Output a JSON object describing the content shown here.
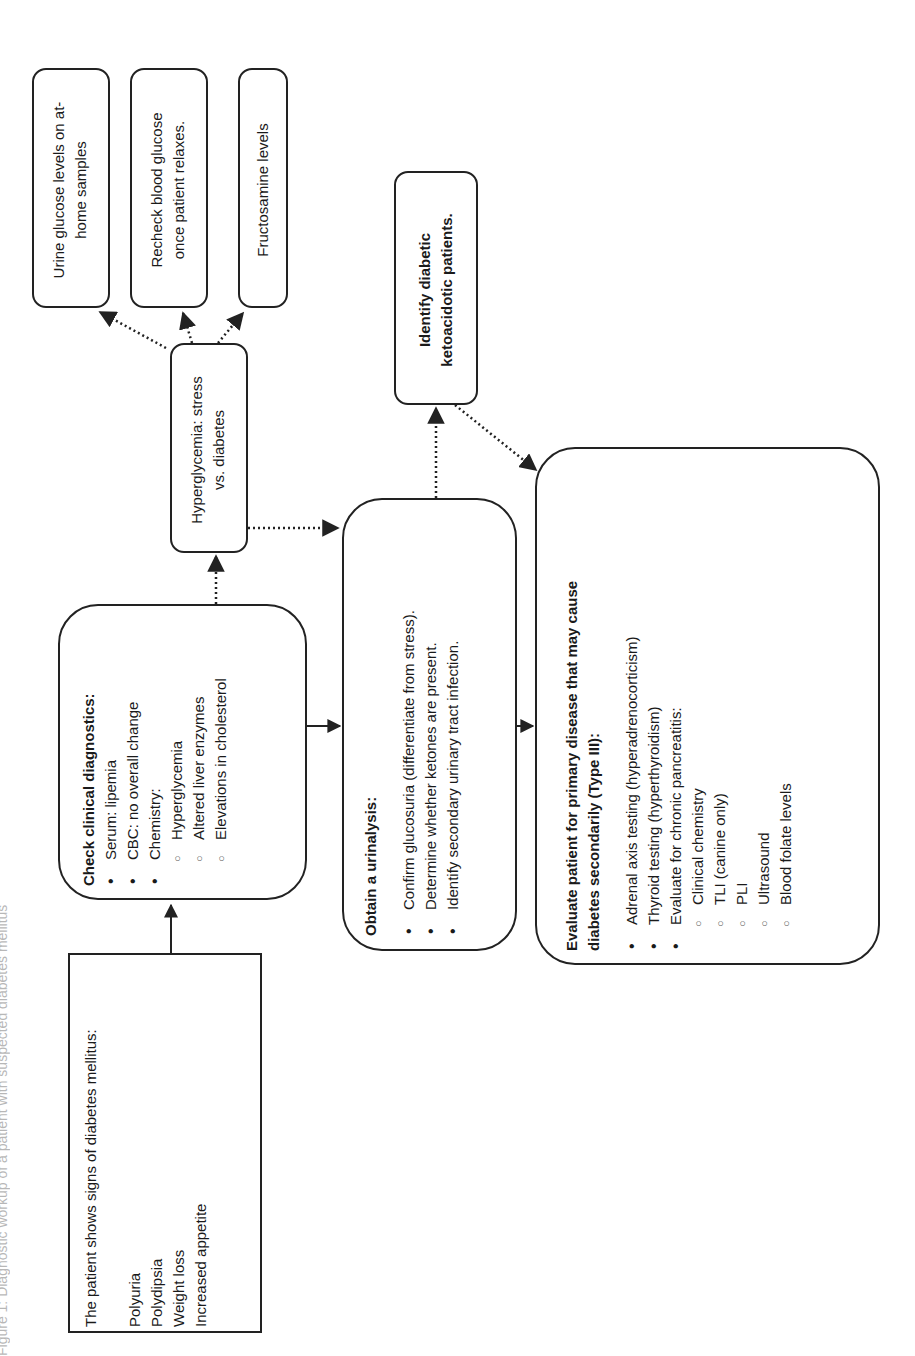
{
  "caption": "Figure 1: Diagnostic workup of a patient with suspected diabetes mellitus",
  "nodes": {
    "signs": {
      "title": "The patient shows signs of diabetes mellitus:",
      "items": [
        "Polyuria",
        "Polydipsia",
        "Weight loss",
        "Increased appetite"
      ]
    },
    "clinical": {
      "title": "Check clinical diagnostics:",
      "items": [
        {
          "text": "Serum: lipemia",
          "level": 1
        },
        {
          "text": "CBC: no overall change",
          "level": 1
        },
        {
          "text": "Chemistry:",
          "level": 1
        },
        {
          "text": "Hyperglycemia",
          "level": 2
        },
        {
          "text": "Altered liver enzymes",
          "level": 2
        },
        {
          "text": "Elevations in cholesterol",
          "level": 2
        }
      ]
    },
    "hyperglycemia": {
      "line1": "Hyperglycemia: stress",
      "line2": "vs. diabetes"
    },
    "urine_glucose": {
      "line1": "Urine glucose levels on at-",
      "line2": "home samples"
    },
    "recheck": {
      "line1": "Recheck blood glucose",
      "line2": "once patient relaxes."
    },
    "fructosamine": {
      "line1": "Fructosamine levels"
    },
    "urinalysis": {
      "title": "Obtain a urinalysis:",
      "items": [
        "Confirm glucosuria (differentiate from stress).",
        "Determine whether ketones are present.",
        "Identify secondary urinary tract infection."
      ]
    },
    "ketoacidotic": {
      "line1": "Identify diabetic",
      "line2": "ketoacidotic patients."
    },
    "type3": {
      "title_line1": "Evaluate patient for primary disease that may cause",
      "title_line2": "diabetes secondarily (Type III):",
      "items": [
        {
          "text": "Adrenal axis testing (hyperadrenocorticism)",
          "level": 1
        },
        {
          "text": "Thyroid testing (hyperthyroidism)",
          "level": 1
        },
        {
          "text": "Evaluate for chronic pancreatitis:",
          "level": 1
        },
        {
          "text": "Clinical chemistry",
          "level": 2
        },
        {
          "text": "TLI (canine only)",
          "level": 2
        },
        {
          "text": "PLI",
          "level": 2
        },
        {
          "text": "Ultrasound",
          "level": 2
        },
        {
          "text": "Blood folate levels",
          "level": 2
        }
      ]
    }
  },
  "edges": [
    {
      "from": "signs",
      "to": "clinical",
      "style": "solid"
    },
    {
      "from": "clinical",
      "to": "hyperglycemia",
      "style": "dotted"
    },
    {
      "from": "clinical",
      "to": "urinalysis",
      "style": "solid"
    },
    {
      "from": "hyperglycemia",
      "to": "urine_glucose",
      "style": "dotted"
    },
    {
      "from": "hyperglycemia",
      "to": "recheck",
      "style": "dotted"
    },
    {
      "from": "hyperglycemia",
      "to": "fructosamine",
      "style": "dotted"
    },
    {
      "from": "hyperglycemia",
      "to": "urinalysis",
      "style": "dotted"
    },
    {
      "from": "urinalysis",
      "to": "ketoacidotic",
      "style": "dotted"
    },
    {
      "from": "urinalysis",
      "to": "type3",
      "style": "solid"
    },
    {
      "from": "ketoacidotic",
      "to": "type3",
      "style": "dotted"
    }
  ],
  "colors": {
    "line": "#222222",
    "background": "#ffffff",
    "text": "#1a1a1a"
  }
}
